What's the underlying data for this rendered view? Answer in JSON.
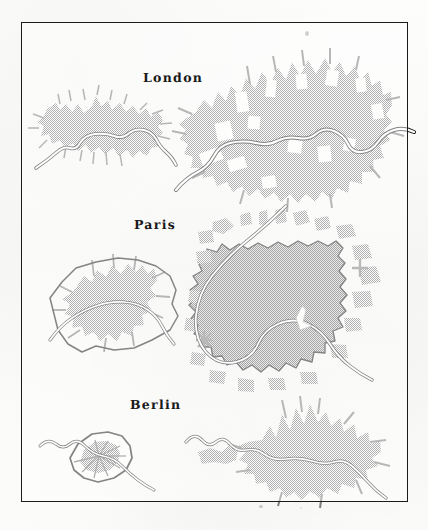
{
  "figure": {
    "kind": "comparative-urban-extent-map-plate",
    "frame": {
      "style": "thin-black-rectangle"
    },
    "paper_color": "#fbfbfa",
    "ink_color": "#1b1b1b",
    "builtup_fill_color": "#8e8e8e",
    "water_fill_color": "#ffffff"
  },
  "rows": [
    {
      "label": "London",
      "label_position": "top-center",
      "panels": [
        {
          "side": "left",
          "era": "historic",
          "river": "Thames",
          "boundary": "none"
        },
        {
          "side": "right",
          "era": "modern",
          "river": "Thames",
          "boundary": "none"
        }
      ]
    },
    {
      "label": "Paris",
      "label_position": "top-center",
      "panels": [
        {
          "side": "left",
          "era": "historic",
          "river": "Seine",
          "boundary": "fortification-ring"
        },
        {
          "side": "right",
          "era": "modern",
          "river": "Seine",
          "boundary": "peripherique-ring"
        }
      ]
    },
    {
      "label": "Berlin",
      "label_position": "top-center",
      "panels": [
        {
          "side": "left",
          "era": "historic",
          "river": "Spree",
          "boundary": "customs-wall"
        },
        {
          "side": "right",
          "era": "modern",
          "river": "Spree",
          "boundary": "none"
        }
      ]
    }
  ],
  "labels": {
    "london": "London",
    "paris": "Paris",
    "berlin": "Berlin"
  }
}
